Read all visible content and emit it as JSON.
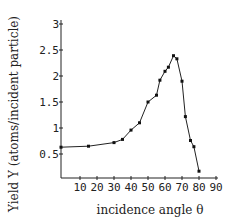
{
  "chart_data": {
    "type": "line",
    "title": "",
    "xlabel": "incidence angle θ",
    "ylabel": "Yield Y (atoms/incident particle)",
    "xlim": [
      0,
      90
    ],
    "ylim": [
      0,
      3
    ],
    "grid": false,
    "legend": null,
    "x_ticks": [
      10,
      20,
      30,
      40,
      50,
      60,
      70,
      80,
      90
    ],
    "x_tick_labels": [
      "10",
      "20",
      "30",
      "40",
      "50",
      "60",
      "70",
      "80",
      "90"
    ],
    "y_ticks": [
      0.5,
      1,
      1.5,
      2,
      2.5,
      3
    ],
    "y_tick_labels": [
      "0.5",
      "1",
      "1.5",
      "2",
      "2.5",
      "3"
    ],
    "series": [
      {
        "name": "Yield",
        "markers": true,
        "x": [
          0,
          15,
          30,
          35,
          40,
          45,
          50,
          55,
          57,
          60,
          62,
          65,
          67,
          70,
          72,
          75,
          77,
          80
        ],
        "y": [
          0.63,
          0.65,
          0.72,
          0.78,
          0.96,
          1.1,
          1.5,
          1.63,
          1.92,
          2.09,
          2.17,
          2.39,
          2.33,
          1.9,
          1.22,
          0.76,
          0.64,
          0.17
        ]
      }
    ]
  }
}
